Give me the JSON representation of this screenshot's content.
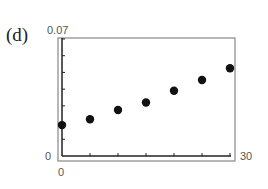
{
  "panel": {
    "label": "(d)"
  },
  "axes": {
    "y_top_label": "0.07",
    "y_bottom_label": "0",
    "x_left_label": "0",
    "x_right_label": "30"
  },
  "chart_data": {
    "type": "scatter",
    "title": "",
    "panel_label": "(d)",
    "xlabel": "",
    "ylabel": "",
    "xlim": [
      0,
      30
    ],
    "ylim": [
      0,
      0.07
    ],
    "x_tick_labels": [
      "0",
      "30"
    ],
    "y_tick_labels": [
      "0",
      "0.07"
    ],
    "grid": false,
    "legend": null,
    "series": [
      {
        "name": "data",
        "x": [
          0,
          5,
          10,
          15,
          20,
          25,
          30
        ],
        "y": [
          0.0185,
          0.022,
          0.0275,
          0.032,
          0.039,
          0.0455,
          0.0525
        ]
      }
    ],
    "colors": {
      "points": "#111111",
      "axes": "#333333",
      "frame": "#888888"
    }
  }
}
